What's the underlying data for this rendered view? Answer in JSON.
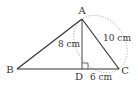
{
  "diagram": {
    "type": "geometry",
    "points": {
      "A": {
        "label": "A",
        "x": 82,
        "y": 19
      },
      "B": {
        "label": "B",
        "x": 17,
        "y": 69
      },
      "C": {
        "label": "C",
        "x": 119,
        "y": 69
      },
      "D": {
        "label": "D",
        "x": 82,
        "y": 69
      }
    },
    "measurements": {
      "AD": "8 cm",
      "AC": "10 cm",
      "DC": "6 cm"
    },
    "colors": {
      "line": "#333333",
      "dotted": "#aaaaaa",
      "background": "#ffffff"
    }
  }
}
